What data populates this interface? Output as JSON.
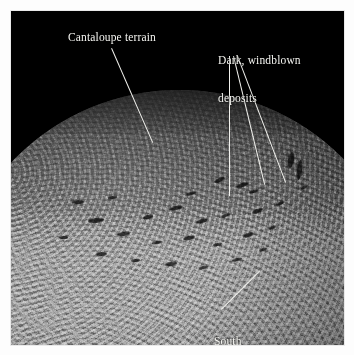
{
  "figure": {
    "background_color": "#ffffff",
    "photo_background_color": "#000000",
    "border_color": "#e9e9e9"
  },
  "annotations": {
    "cantaloupe": {
      "label": "Cantaloupe terrain",
      "line_color": "#f2f2ee",
      "text_color": "#f4f4f0"
    },
    "deposits": {
      "line1": "Dark, windblown",
      "line2": "deposits",
      "line_color": "#f2f2ee",
      "text_color": "#f4f4f0"
    },
    "south_pole": {
      "line1": "South",
      "line2": "polar region",
      "line_color": "#f2f2ee",
      "text_color": "#f4f4f0"
    }
  },
  "planet": {
    "name": "planet-body",
    "terrain_bands": [
      {
        "name": "dark-northern-limb",
        "color": "#141414"
      },
      {
        "name": "cantaloupe-terrain",
        "color": "#5a5a5a"
      },
      {
        "name": "bright-transition-band",
        "color": "#909090"
      },
      {
        "name": "south-polar-cap",
        "color": "#9a9a9a"
      }
    ],
    "space_color": "#000000"
  },
  "streaks": [
    {
      "x": 214,
      "y": 178,
      "w": 11,
      "h": 4,
      "r": -24
    },
    {
      "x": 236,
      "y": 183,
      "w": 13,
      "h": 4,
      "r": -20
    },
    {
      "x": 249,
      "y": 190,
      "w": 9,
      "h": 3,
      "r": -18
    },
    {
      "x": 288,
      "y": 152,
      "w": 6,
      "h": 16,
      "r": 8
    },
    {
      "x": 297,
      "y": 160,
      "w": 5,
      "h": 20,
      "r": 6
    },
    {
      "x": 169,
      "y": 206,
      "w": 14,
      "h": 4,
      "r": -14
    },
    {
      "x": 143,
      "y": 215,
      "w": 10,
      "h": 4,
      "r": -12
    },
    {
      "x": 196,
      "y": 219,
      "w": 12,
      "h": 4,
      "r": -16
    },
    {
      "x": 221,
      "y": 214,
      "w": 9,
      "h": 3,
      "r": -22
    },
    {
      "x": 252,
      "y": 209,
      "w": 11,
      "h": 4,
      "r": -20
    },
    {
      "x": 276,
      "y": 202,
      "w": 8,
      "h": 3,
      "r": -24
    },
    {
      "x": 117,
      "y": 232,
      "w": 13,
      "h": 4,
      "r": -8
    },
    {
      "x": 152,
      "y": 241,
      "w": 10,
      "h": 3,
      "r": -10
    },
    {
      "x": 183,
      "y": 236,
      "w": 12,
      "h": 4,
      "r": -14
    },
    {
      "x": 213,
      "y": 243,
      "w": 9,
      "h": 3,
      "r": -12
    },
    {
      "x": 243,
      "y": 233,
      "w": 11,
      "h": 4,
      "r": -18
    },
    {
      "x": 268,
      "y": 226,
      "w": 8,
      "h": 3,
      "r": -20
    },
    {
      "x": 96,
      "y": 252,
      "w": 11,
      "h": 4,
      "r": -4
    },
    {
      "x": 131,
      "y": 259,
      "w": 9,
      "h": 3,
      "r": -6
    },
    {
      "x": 165,
      "y": 262,
      "w": 12,
      "h": 4,
      "r": -8
    },
    {
      "x": 199,
      "y": 266,
      "w": 9,
      "h": 3,
      "r": -10
    },
    {
      "x": 232,
      "y": 258,
      "w": 10,
      "h": 3,
      "r": -14
    },
    {
      "x": 259,
      "y": 248,
      "w": 8,
      "h": 3,
      "r": -18
    },
    {
      "x": 88,
      "y": 218,
      "w": 16,
      "h": 5,
      "r": -6
    },
    {
      "x": 72,
      "y": 200,
      "w": 12,
      "h": 4,
      "r": -4
    },
    {
      "x": 59,
      "y": 236,
      "w": 9,
      "h": 3,
      "r": 0
    },
    {
      "x": 300,
      "y": 186,
      "w": 7,
      "h": 3,
      "r": -28
    },
    {
      "x": 186,
      "y": 192,
      "w": 10,
      "h": 3,
      "r": -18
    },
    {
      "x": 108,
      "y": 196,
      "w": 9,
      "h": 3,
      "r": -8
    }
  ]
}
